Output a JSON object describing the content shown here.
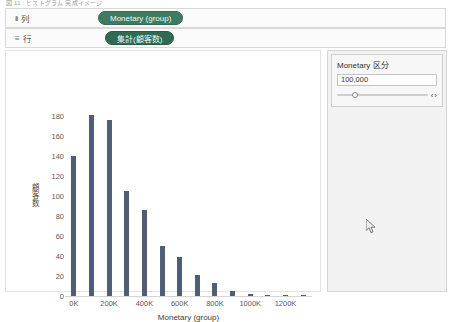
{
  "top_caption": "図 11 : ヒストグラム 完成イメージ",
  "shelves": {
    "columns": {
      "label": "列",
      "glyph": "iii",
      "pill": "Monetary (group)"
    },
    "rows": {
      "label": "行",
      "glyph": "≡",
      "pill": "集計(顧客数)"
    }
  },
  "parameter_panel": {
    "title": "Monetary 区分",
    "value": "100,000",
    "slider_position_pct": 20,
    "arrow_left": "‹",
    "arrow_right": "›"
  },
  "chart_data": {
    "type": "bar",
    "title": "",
    "xlabel": "Monetary (group)",
    "ylabel": "顧客数",
    "categories": [
      0,
      100000,
      200000,
      300000,
      400000,
      500000,
      600000,
      700000,
      800000,
      900000,
      1000000,
      1100000,
      1200000,
      1300000
    ],
    "tick_labels": [
      "0K",
      "200K",
      "400K",
      "600K",
      "800K",
      "1000K",
      "1200K"
    ],
    "tick_values": [
      0,
      200000,
      400000,
      600000,
      800000,
      1000000,
      1200000
    ],
    "values": [
      140,
      181,
      176,
      105,
      86,
      50,
      39,
      21,
      13,
      5,
      2,
      1,
      1,
      1
    ],
    "ylim": [
      0,
      190
    ],
    "ytick_values": [
      0,
      20,
      40,
      60,
      80,
      100,
      120,
      140,
      160,
      180
    ],
    "ytick_labels": [
      "0",
      "20",
      "40",
      "60",
      "80",
      "100",
      "120",
      "140",
      "160",
      "180"
    ],
    "xlim": [
      -50000,
      1350000
    ],
    "grid": false,
    "legend": "none",
    "bar_color": "#4f5d75"
  }
}
